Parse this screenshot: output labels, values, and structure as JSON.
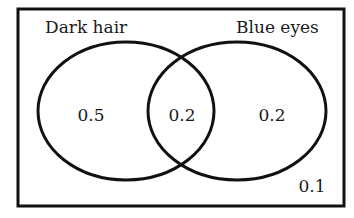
{
  "diagram": {
    "type": "venn",
    "sets": [
      {
        "name": "Dark hair",
        "only_value": "0.5"
      },
      {
        "name": "Blue eyes",
        "only_value": "0.2"
      }
    ],
    "intersection_value": "0.2",
    "outside_value": "0.1",
    "colors": {
      "stroke": "#111111",
      "background": "#ffffff",
      "text": "#1a1a1a"
    }
  },
  "labels": {
    "set_a": "Dark hair",
    "set_b": "Blue eyes",
    "a_only": "0.5",
    "both": "0.2",
    "b_only": "0.2",
    "neither": "0.1"
  }
}
